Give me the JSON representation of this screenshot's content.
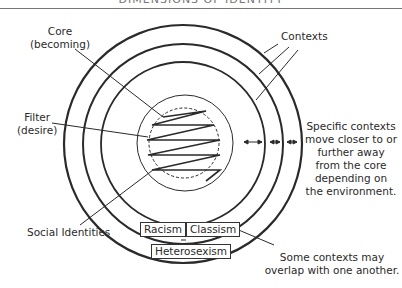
{
  "title": "DIMENSIONS OF IDENTITY",
  "labels": {
    "core": [
      "Core",
      "(becoming)"
    ],
    "filter": [
      "Filter",
      "(desire)"
    ],
    "social_identities": "Social Identities",
    "contexts": "Contexts",
    "specific_contexts": [
      "Specific contexts",
      "move closer to or",
      "further away",
      "from the core",
      "depending on",
      "the environment."
    ],
    "overlap": [
      "Some contexts may",
      "overlap with one another."
    ]
  },
  "contexts": {
    "racism": "Racism",
    "classism": "Classism",
    "heterosexism": "Heterosexism"
  },
  "colors": {
    "line": "#2a2a2a",
    "text": "#2a2a2a"
  }
}
